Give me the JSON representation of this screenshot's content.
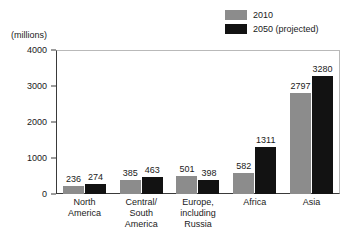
{
  "chart_data": {
    "type": "bar",
    "title": "",
    "subtitle": "",
    "xlabel": "",
    "ylabel": "",
    "unit_label": "(millions)",
    "grid": false,
    "legend_position": "top-right",
    "ylim": [
      0,
      4000
    ],
    "yticks": [
      4000,
      3000,
      2000,
      1000,
      0
    ],
    "ytick_labels": [
      "4000",
      "3000",
      "2000",
      "1000",
      "0"
    ],
    "categories": [
      "North America",
      "Central/ South America",
      "Europe, including Russia",
      "Africa",
      "Asia"
    ],
    "category_lines": [
      [
        "North",
        "America"
      ],
      [
        "Central/",
        "South",
        "America"
      ],
      [
        "Europe,",
        "including",
        "Russia"
      ],
      [
        "Africa"
      ],
      [
        "Asia"
      ]
    ],
    "series": [
      {
        "name": "2010",
        "color": "#8c8c8c",
        "values": [
          236,
          385,
          501,
          582,
          2797
        ],
        "labels": [
          "236",
          "385",
          "501",
          "582",
          "2797"
        ]
      },
      {
        "name": "2050 (projected)",
        "color": "#121212",
        "values": [
          274,
          463,
          398,
          1311,
          3280
        ],
        "labels": [
          "274",
          "463",
          "398",
          "1311",
          "3280"
        ]
      }
    ]
  },
  "legend": {
    "items": [
      {
        "label": "2010",
        "color": "#8c8c8c"
      },
      {
        "label": "2050 (projected)",
        "color": "#121212"
      }
    ]
  },
  "axis": {
    "unit": "(millions)"
  }
}
